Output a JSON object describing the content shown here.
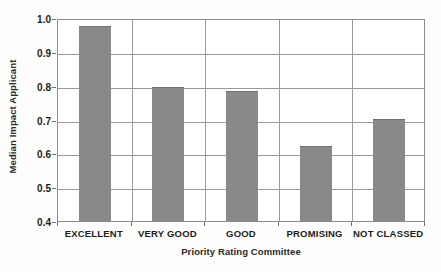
{
  "chart_data": {
    "type": "bar",
    "title": "",
    "subtitle": "",
    "xlabel": "Priority Rating Committee",
    "ylabel": "Median Impact Applicant",
    "categories": [
      "EXCELLENT",
      "VERY GOOD",
      "GOOD",
      "PROMISING",
      "NOT CLASSED"
    ],
    "values": [
      0.975,
      0.795,
      0.785,
      0.622,
      0.702
    ],
    "series": [
      {
        "name": "Median Impact Applicant",
        "values": [
          0.975,
          0.795,
          0.785,
          0.622,
          0.702
        ]
      }
    ],
    "ylim": [
      0.4,
      1.0
    ],
    "yticks": [
      0.4,
      0.5,
      0.6,
      0.7,
      0.8,
      0.9,
      1.0
    ],
    "ytick_labels": [
      "0.4",
      "0.5",
      "0.6",
      "0.7",
      "0.8",
      "0.9",
      "1.0"
    ],
    "grid": "horizontal-and-vertical",
    "legend": "none",
    "bar_color": "#898989",
    "axis_color": "#8c8c8c",
    "gridline_color": "#9a9a9a",
    "background_color": "#ffffff"
  }
}
